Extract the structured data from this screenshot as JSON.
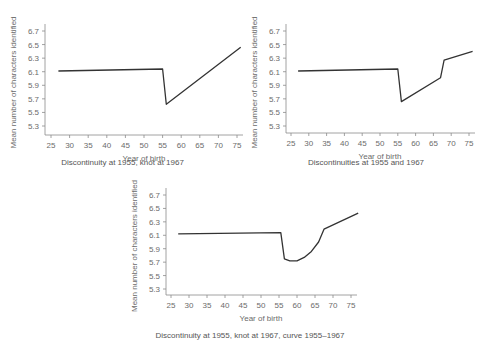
{
  "figure": {
    "panels": [
      {
        "caption": "Discontinuity at 1955, knot at 1967"
      },
      {
        "caption": "Discontinuities at 1955 and 1967"
      },
      {
        "caption": "Discontinuity at 1955, knot at 1967, curve 1955–1967"
      }
    ]
  },
  "chart_data": [
    {
      "type": "line",
      "title": "Discontinuity at 1955, knot at 1967",
      "xlabel": "Year of birth",
      "ylabel": "Mean number of characters identified",
      "xlim": [
        25,
        77
      ],
      "ylim": [
        5.2,
        6.75
      ],
      "xticks": [
        25,
        30,
        35,
        40,
        45,
        50,
        55,
        60,
        65,
        70,
        75
      ],
      "yticks": [
        5.3,
        5.5,
        5.7,
        5.9,
        6.1,
        6.3,
        6.5,
        6.7
      ],
      "grid": false,
      "series": [
        {
          "name": "fit",
          "x": [
            27,
            55,
            56,
            76
          ],
          "y": [
            6.11,
            6.14,
            5.62,
            6.46
          ]
        }
      ]
    },
    {
      "type": "line",
      "title": "Discontinuities at 1955 and 1967",
      "xlabel": "Year of birth",
      "ylabel": "Mean number of characters identified",
      "xlim": [
        25,
        77
      ],
      "ylim": [
        5.2,
        6.75
      ],
      "xticks": [
        25,
        30,
        35,
        40,
        45,
        50,
        55,
        60,
        65,
        70,
        75
      ],
      "yticks": [
        5.3,
        5.5,
        5.7,
        5.9,
        6.1,
        6.3,
        6.5,
        6.7
      ],
      "grid": false,
      "series": [
        {
          "name": "fit",
          "x": [
            27,
            55,
            56,
            67,
            68,
            76
          ],
          "y": [
            6.11,
            6.14,
            5.66,
            6.01,
            6.27,
            6.4
          ]
        }
      ]
    },
    {
      "type": "line",
      "title": "Discontinuity at 1955, knot at 1967, curve 1955–1967",
      "xlabel": "Year of birth",
      "ylabel": "Mean number of characters identified",
      "xlim": [
        25,
        77
      ],
      "ylim": [
        5.2,
        6.75
      ],
      "xticks": [
        25,
        30,
        35,
        40,
        45,
        50,
        55,
        60,
        65,
        70,
        75
      ],
      "yticks": [
        5.3,
        5.5,
        5.7,
        5.9,
        6.1,
        6.3,
        6.5,
        6.7
      ],
      "grid": false,
      "series": [
        {
          "name": "fit",
          "x": [
            27,
            55.5,
            56.5,
            58,
            60,
            62,
            64,
            66,
            67.5,
            77
          ],
          "y": [
            6.12,
            6.14,
            5.75,
            5.72,
            5.72,
            5.77,
            5.86,
            6.0,
            6.19,
            6.43
          ]
        }
      ]
    }
  ]
}
